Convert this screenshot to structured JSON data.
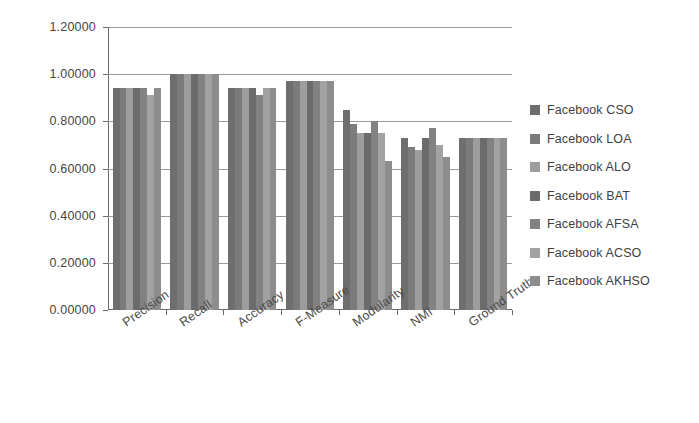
{
  "chart_data": {
    "type": "bar",
    "title": "",
    "xlabel": "",
    "ylabel": "",
    "ylim": [
      0,
      1.2
    ],
    "ytick_step": 0.2,
    "ytick_labels": [
      "0.00000",
      "0.20000",
      "0.40000",
      "0.60000",
      "0.80000",
      "1.00000",
      "1.20000"
    ],
    "ytick_values": [
      0.0,
      0.2,
      0.4,
      0.6,
      0.8,
      1.0,
      1.2
    ],
    "grid": true,
    "grid_axis": "y",
    "legend_position": "right",
    "categories": [
      "Precision",
      "Recall",
      "Accuracy",
      "F-Measure",
      "Modularity",
      "NMI",
      "Ground Truth"
    ],
    "series": [
      {
        "name": "Facebook CSO",
        "color": "#6e6e6e",
        "values": [
          0.94,
          1.0,
          0.94,
          0.97,
          0.85,
          0.73,
          0.73
        ]
      },
      {
        "name": "Facebook LOA",
        "color": "#7b7b7b",
        "values": [
          0.94,
          1.0,
          0.94,
          0.97,
          0.79,
          0.69,
          0.73
        ]
      },
      {
        "name": "Facebook ALO",
        "color": "#9d9d9d",
        "values": [
          0.94,
          1.0,
          0.94,
          0.97,
          0.75,
          0.68,
          0.73
        ]
      },
      {
        "name": "Facebook BAT",
        "color": "#6b6b6b",
        "values": [
          0.94,
          1.0,
          0.94,
          0.97,
          0.75,
          0.73,
          0.73
        ]
      },
      {
        "name": "Facebook AFSA",
        "color": "#828282",
        "values": [
          0.94,
          1.0,
          0.91,
          0.97,
          0.8,
          0.77,
          0.73
        ]
      },
      {
        "name": "Facebook ACSO",
        "color": "#a2a2a2",
        "values": [
          0.91,
          1.0,
          0.94,
          0.97,
          0.75,
          0.7,
          0.73
        ]
      },
      {
        "name": "Facebook AKHSO",
        "color": "#8d8d8d",
        "values": [
          0.94,
          1.0,
          0.94,
          0.97,
          0.63,
          0.65,
          0.73
        ]
      }
    ]
  },
  "legend": {
    "items": [
      {
        "label": "Facebook CSO"
      },
      {
        "label": "Facebook LOA"
      },
      {
        "label": "Facebook ALO"
      },
      {
        "label": "Facebook BAT"
      },
      {
        "label": "Facebook AFSA"
      },
      {
        "label": "Facebook ACSO"
      },
      {
        "label": "Facebook AKHSO"
      }
    ]
  }
}
